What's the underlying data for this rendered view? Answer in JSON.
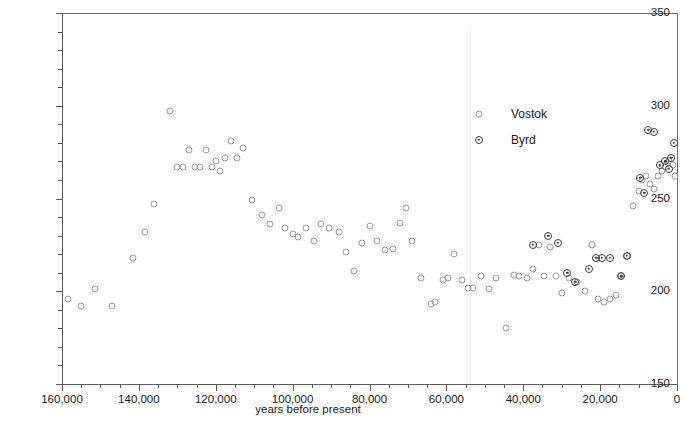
{
  "chart_data": {
    "type": "scatter",
    "title": "",
    "xlabel": "years before present",
    "ylabel": "atmospheric CO2 concentration (microliters per liter)",
    "ylabel_parts": {
      "pre": "atmospheric CO",
      "sub": "2",
      "post": " concentration (microliters per liter)"
    },
    "xlim": [
      160000,
      0
    ],
    "ylim": [
      150,
      350
    ],
    "x_reversed": true,
    "grid": false,
    "x_major_ticks": [
      160000,
      140000,
      120000,
      100000,
      80000,
      60000,
      40000,
      20000,
      0
    ],
    "x_tick_labels": [
      "160,000",
      "140,000",
      "120,000",
      "100,000",
      "80,000",
      "60,000",
      "40,000",
      "20,000",
      "0"
    ],
    "x_minor_interval": 5000,
    "y_major_ticks": [
      150,
      200,
      250,
      300,
      350
    ],
    "y_tick_labels": [
      "150",
      "200",
      "250",
      "300",
      "350"
    ],
    "y_minor_interval": 10,
    "legend_position": "upper-right-inside",
    "series": [
      {
        "name": "Vostok",
        "marker": "open-circle",
        "color": "#9a9a9a",
        "points": [
          [
            158500,
            196
          ],
          [
            155000,
            192
          ],
          [
            151500,
            201
          ],
          [
            147000,
            192
          ],
          [
            141500,
            218
          ],
          [
            138500,
            232
          ],
          [
            136000,
            247
          ],
          [
            132000,
            297
          ],
          [
            130000,
            267
          ],
          [
            128500,
            267
          ],
          [
            127000,
            276
          ],
          [
            125500,
            267
          ],
          [
            124000,
            267
          ],
          [
            122500,
            276
          ],
          [
            121000,
            267
          ],
          [
            120000,
            270
          ],
          [
            119000,
            265
          ],
          [
            117500,
            272
          ],
          [
            116000,
            281
          ],
          [
            114500,
            272
          ],
          [
            113000,
            277
          ],
          [
            110500,
            249
          ],
          [
            108000,
            241
          ],
          [
            106000,
            236
          ],
          [
            103500,
            245
          ],
          [
            102000,
            234
          ],
          [
            100000,
            231
          ],
          [
            98500,
            229
          ],
          [
            96500,
            234
          ],
          [
            94500,
            227
          ],
          [
            92500,
            236
          ],
          [
            90500,
            234
          ],
          [
            88000,
            232
          ],
          [
            86000,
            221
          ],
          [
            84000,
            211
          ],
          [
            82000,
            226
          ],
          [
            80000,
            235
          ],
          [
            78000,
            227
          ],
          [
            76000,
            222
          ],
          [
            74000,
            223
          ],
          [
            72000,
            237
          ],
          [
            70500,
            245
          ],
          [
            69000,
            227
          ],
          [
            66500,
            207
          ],
          [
            64000,
            193
          ],
          [
            63000,
            194
          ],
          [
            61000,
            206
          ],
          [
            59500,
            207
          ],
          [
            58000,
            220
          ],
          [
            56000,
            206
          ],
          [
            54500,
            202
          ],
          [
            53000,
            202
          ],
          [
            51000,
            208
          ],
          [
            49000,
            201
          ],
          [
            47000,
            207
          ],
          [
            44500,
            180
          ],
          [
            42500,
            209
          ],
          [
            41000,
            208
          ],
          [
            39000,
            207
          ],
          [
            37500,
            212
          ],
          [
            36000,
            225
          ],
          [
            34500,
            208
          ],
          [
            33000,
            224
          ],
          [
            31500,
            208
          ],
          [
            30000,
            199
          ],
          [
            28000,
            207
          ],
          [
            26000,
            205
          ],
          [
            24000,
            200
          ],
          [
            22000,
            225
          ],
          [
            20500,
            196
          ],
          [
            19000,
            194
          ],
          [
            17500,
            196
          ],
          [
            16000,
            198
          ],
          [
            14500,
            208
          ],
          [
            13000,
            219
          ],
          [
            11500,
            246
          ],
          [
            10000,
            254
          ],
          [
            9000,
            260
          ],
          [
            8000,
            262
          ],
          [
            7000,
            258
          ],
          [
            6000,
            255
          ],
          [
            5000,
            262
          ],
          [
            4000,
            265
          ],
          [
            3000,
            267
          ],
          [
            2000,
            270
          ],
          [
            1000,
            268
          ],
          [
            500,
            262
          ]
        ]
      },
      {
        "name": "Byrd",
        "marker": "dot-circle",
        "color": "#3d3d3d",
        "points": [
          [
            37500,
            225
          ],
          [
            33500,
            230
          ],
          [
            31000,
            226
          ],
          [
            28500,
            210
          ],
          [
            26500,
            205
          ],
          [
            23000,
            212
          ],
          [
            21000,
            218
          ],
          [
            19500,
            218
          ],
          [
            17500,
            218
          ],
          [
            14500,
            208
          ],
          [
            13000,
            219
          ],
          [
            9500,
            261
          ],
          [
            8500,
            253
          ],
          [
            7500,
            287
          ],
          [
            6000,
            286
          ],
          [
            4500,
            268
          ],
          [
            3000,
            270
          ],
          [
            2200,
            266
          ],
          [
            1500,
            272
          ],
          [
            800,
            280
          ]
        ]
      }
    ]
  },
  "legend": {
    "items": [
      {
        "label": "Vostok",
        "marker": "open-circle"
      },
      {
        "label": "Byrd",
        "marker": "dot-circle"
      }
    ]
  }
}
